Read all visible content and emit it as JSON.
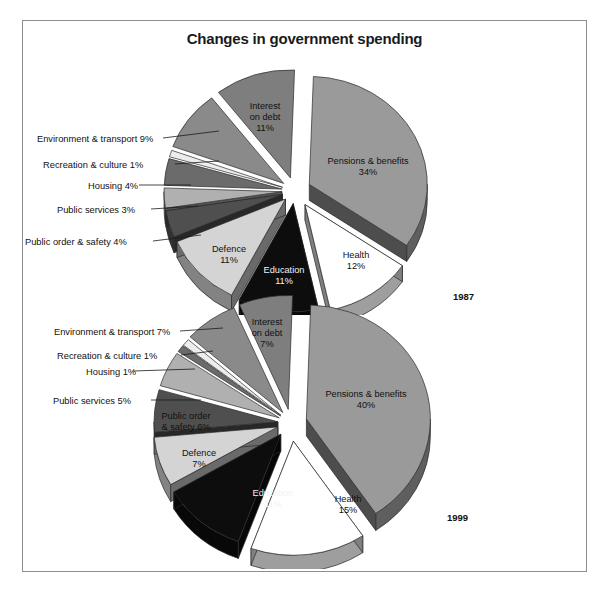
{
  "title": "Changes in government spending",
  "charts": [
    {
      "year": "1987",
      "labels_outside": [
        {
          "text": "Environment & transport 9%"
        },
        {
          "text": "Recreation & culture 1%"
        },
        {
          "text": "Housing 4%"
        },
        {
          "text": "Public services 3%"
        },
        {
          "text": "Public order & safety 4%"
        }
      ],
      "labels_inside": [
        {
          "text": "Interest\non debt\n11%"
        },
        {
          "text": "Pensions & benefits\n34%"
        },
        {
          "text": "Health\n12%"
        },
        {
          "text": "Education\n11%"
        },
        {
          "text": "Defence\n11%"
        }
      ]
    },
    {
      "year": "1999",
      "labels_outside": [
        {
          "text": "Environment & transport 7%"
        },
        {
          "text": "Recreation & culture 1%"
        },
        {
          "text": "Housing 1%"
        },
        {
          "text": "Public services 5%"
        }
      ],
      "labels_inside": [
        {
          "text": "Interest\non debt\n7%"
        },
        {
          "text": "Pensions & benefits\n40%"
        },
        {
          "text": "Health\n15%"
        },
        {
          "text": "Education\n11%"
        },
        {
          "text": "Defence\n7%"
        },
        {
          "text": "Public order\n& safety 6%"
        }
      ]
    }
  ],
  "chart_data": [
    {
      "type": "pie",
      "title": "Changes in government spending",
      "subtitle": "1987",
      "exploded": true,
      "three_d": true,
      "legend": "none",
      "categories": [
        "Pensions & benefits",
        "Health",
        "Education",
        "Defence",
        "Public order & safety",
        "Public services",
        "Housing",
        "Recreation & culture",
        "Environment & transport",
        "Interest on debt"
      ],
      "values": [
        34,
        12,
        11,
        11,
        4,
        3,
        4,
        1,
        9,
        11
      ],
      "unit": "%",
      "colors": [
        "#9a9a9a",
        "#ffffff",
        "#0d0d0d",
        "#d4d4d4",
        "#4f4f4f",
        "#b0b0b0",
        "#6b6b6b",
        "#ededed",
        "#8a8a8a",
        "#7e7e7e"
      ]
    },
    {
      "type": "pie",
      "title": "Changes in government spending",
      "subtitle": "1999",
      "exploded": true,
      "three_d": true,
      "legend": "none",
      "categories": [
        "Pensions & benefits",
        "Health",
        "Education",
        "Defence",
        "Public order & safety",
        "Public services",
        "Housing",
        "Recreation & culture",
        "Environment & transport",
        "Interest on debt"
      ],
      "values": [
        40,
        15,
        11,
        7,
        6,
        5,
        1,
        1,
        7,
        7
      ],
      "unit": "%",
      "colors": [
        "#9a9a9a",
        "#ffffff",
        "#0d0d0d",
        "#d4d4d4",
        "#4f4f4f",
        "#b0b0b0",
        "#6b6b6b",
        "#ededed",
        "#8a8a8a",
        "#7e7e7e"
      ]
    }
  ]
}
